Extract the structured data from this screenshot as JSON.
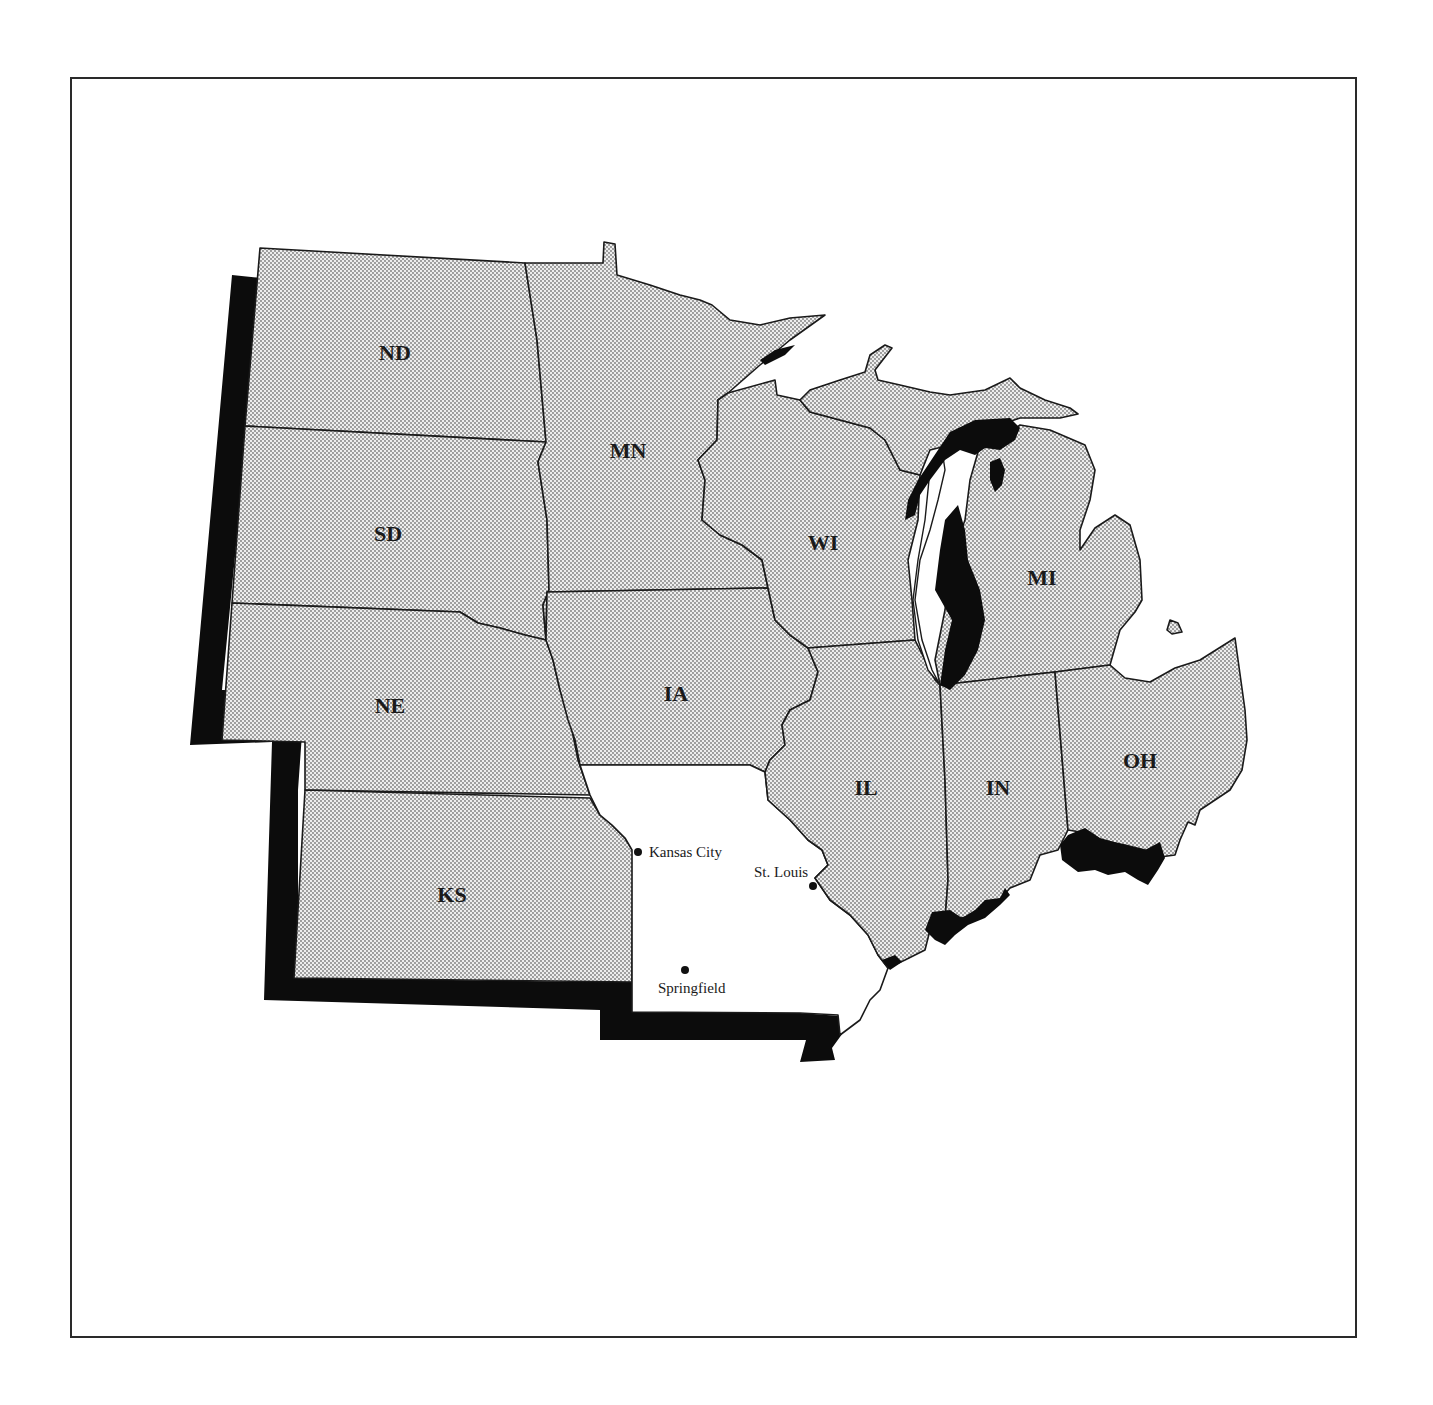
{
  "map": {
    "highlighted_state": "MO",
    "highlight_fill": "#ffffff",
    "other_state_fill": "dotted-gray",
    "shadow_color": "#0c0c0c",
    "states": [
      {
        "code": "ND",
        "label": "ND"
      },
      {
        "code": "SD",
        "label": "SD"
      },
      {
        "code": "NE",
        "label": "NE"
      },
      {
        "code": "KS",
        "label": "KS"
      },
      {
        "code": "MN",
        "label": "MN"
      },
      {
        "code": "IA",
        "label": "IA"
      },
      {
        "code": "WI",
        "label": "WI"
      },
      {
        "code": "MI",
        "label": "MI"
      },
      {
        "code": "IL",
        "label": "IL"
      },
      {
        "code": "IN",
        "label": "IN"
      },
      {
        "code": "OH",
        "label": "OH"
      }
    ],
    "cities": [
      {
        "name": "Kansas City",
        "label": "Kansas City"
      },
      {
        "name": "St. Louis",
        "label": "St. Louis"
      },
      {
        "name": "Springfield",
        "label": "Springfield"
      }
    ]
  }
}
